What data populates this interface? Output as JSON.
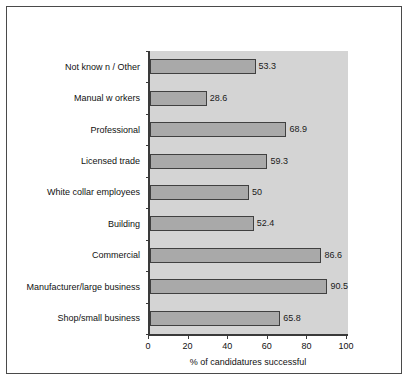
{
  "chart_data": {
    "type": "bar",
    "orientation": "horizontal",
    "title": "",
    "xlabel": "% of candidatures successful",
    "ylabel": "",
    "xlim": [
      0,
      100
    ],
    "xticks": [
      "0",
      "20",
      "40",
      "60",
      "80",
      "100"
    ],
    "grid": false,
    "legend": false,
    "categories": [
      "Not know n / Other",
      "Manual w orkers",
      "Professional",
      "Licensed trade",
      "White collar employees",
      "Building",
      "Commercial",
      "Manufacturer/large business",
      "Shop/small business"
    ],
    "values": [
      53.3,
      28.6,
      68.9,
      59.3,
      50,
      52.4,
      86.6,
      90.5,
      65.8
    ],
    "value_labels": [
      "53.3",
      "28.6",
      "68.9",
      "59.3",
      "50",
      "52.4",
      "86.6",
      "90.5",
      "65.8"
    ],
    "colors": {
      "bar_fill": "#a9a9a9",
      "bar_edge": "#404040",
      "plot_background": "#d4d4d4",
      "axis": "#3a3a3a",
      "frame": "#4a4a4a",
      "text": "#111111",
      "page_background": "#ffffff"
    }
  }
}
